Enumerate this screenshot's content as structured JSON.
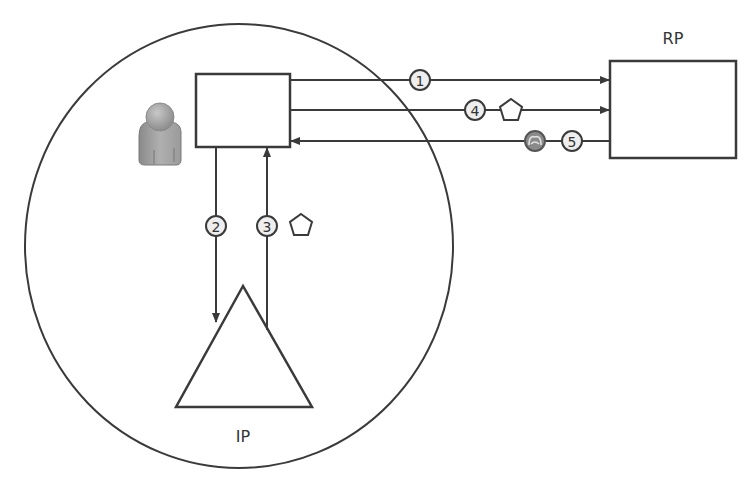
{
  "diagram": {
    "colors": {
      "stroke": "#3a3a3a",
      "badge_fill": "#eeeeee",
      "token_fill": "#8a8a8a",
      "user_icon": "#9a9a9a",
      "background": "#ffffff"
    },
    "nodes": {
      "client": {
        "label": ""
      },
      "rp": {
        "label": "RP"
      },
      "ip": {
        "label": "IP"
      },
      "user": {
        "icon": "user-icon"
      }
    },
    "steps": [
      {
        "n": "1",
        "from": "client",
        "to": "rp",
        "token": null
      },
      {
        "n": "2",
        "from": "client",
        "to": "ip",
        "token": null
      },
      {
        "n": "3",
        "from": "ip",
        "to": "client",
        "token": "pentagon-icon"
      },
      {
        "n": "4",
        "from": "client",
        "to": "rp",
        "token": "pentagon-icon"
      },
      {
        "n": "5",
        "from": "rp",
        "to": "client",
        "token": "session-token-icon"
      }
    ],
    "boundary": {
      "shape": "circle",
      "encloses": [
        "user",
        "client",
        "ip"
      ]
    }
  }
}
